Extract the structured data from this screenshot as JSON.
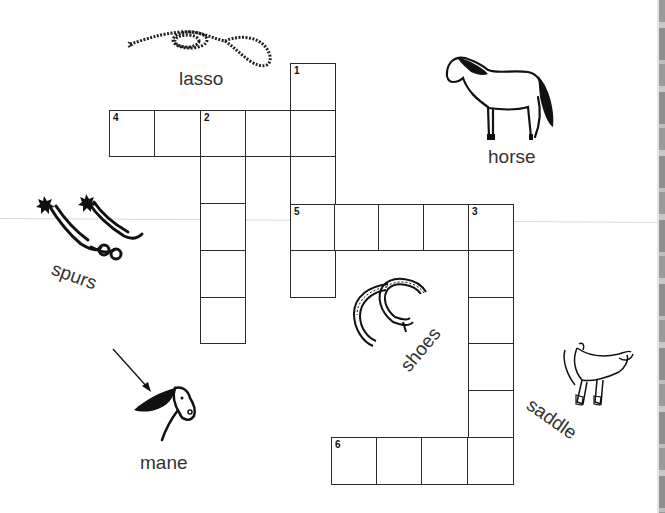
{
  "puzzle": {
    "type": "crossword",
    "theme": "horse / cowboy",
    "clue_numbers": [
      "1",
      "2",
      "3",
      "4",
      "5",
      "6"
    ],
    "entries": [
      {
        "number": "1",
        "direction": "down",
        "length": 5
      },
      {
        "number": "2",
        "direction": "down",
        "length": 5
      },
      {
        "number": "3",
        "direction": "down",
        "length": 6
      },
      {
        "number": "4",
        "direction": "across",
        "length": 5
      },
      {
        "number": "5",
        "direction": "across",
        "length": 5
      },
      {
        "number": "6",
        "direction": "across",
        "length": 4
      }
    ]
  },
  "word_bank": {
    "lasso": "lasso",
    "horse": "horse",
    "spurs": "spurs",
    "shoes": "shoes",
    "saddle": "saddle",
    "mane": "mane"
  },
  "pictures": [
    "lasso-icon",
    "horse-icon",
    "spurs-icon",
    "horseshoes-icon",
    "saddle-icon",
    "horse-head-icon",
    "arrow-icon"
  ],
  "colors": {
    "line": "#2a2a2a",
    "text": "#333333",
    "background": "#ffffff"
  }
}
